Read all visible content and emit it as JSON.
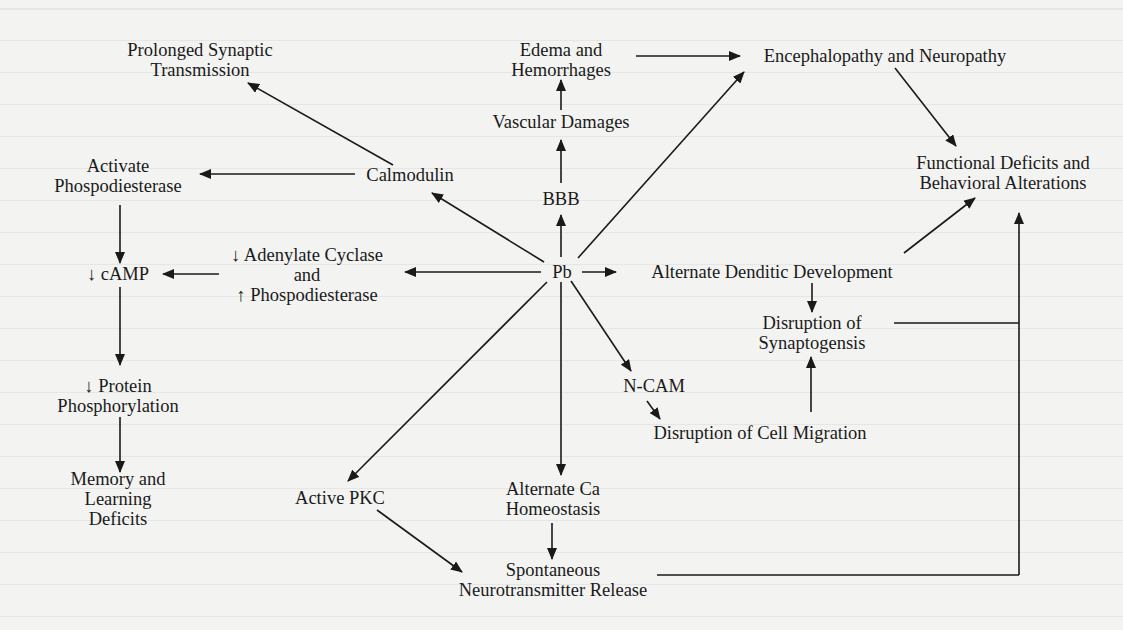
{
  "diagram": {
    "type": "flow",
    "colors": {
      "ink": "#1a1a1a",
      "paper": "#f3f3f2"
    },
    "nodes": {
      "pb": {
        "lines": [
          "Pb"
        ]
      },
      "prolonged": {
        "lines": [
          "Prolonged Synaptic",
          "Transmission"
        ]
      },
      "edema": {
        "lines": [
          "Edema and",
          "Hemorrhages"
        ]
      },
      "enceph": {
        "lines": [
          "Encephalopathy and Neuropathy"
        ]
      },
      "vascular": {
        "lines": [
          "Vascular Damages"
        ]
      },
      "activate_pde": {
        "lines": [
          "Activate",
          "Phospodiesterase"
        ]
      },
      "calmodulin": {
        "lines": [
          "Calmodulin"
        ]
      },
      "bbb": {
        "lines": [
          "BBB"
        ]
      },
      "functional": {
        "lines": [
          "Functional Deficits and",
          "Behavioral Alterations"
        ]
      },
      "adenylate": {
        "lines": [
          "↓ Adenylate Cyclase",
          "and",
          "↑ Phospodiesterase"
        ]
      },
      "camp": {
        "lines": [
          "↓ cAMP"
        ]
      },
      "dendritic": {
        "lines": [
          "Alternate Denditic Development"
        ]
      },
      "synaptogenesis": {
        "lines": [
          "Disruption of",
          "Synaptogensis"
        ]
      },
      "protein": {
        "lines": [
          "↓ Protein",
          "Phosphorylation"
        ]
      },
      "ncam": {
        "lines": [
          "N-CAM"
        ]
      },
      "cell_migration": {
        "lines": [
          "Disruption of Cell Migration"
        ]
      },
      "memory": {
        "lines": [
          "Memory and",
          "Learning",
          "Deficits"
        ]
      },
      "pkc": {
        "lines": [
          "Active PKC"
        ]
      },
      "ca": {
        "lines": [
          "Alternate Ca",
          "Homeostasis"
        ]
      },
      "spontaneous": {
        "lines": [
          "Spontaneous",
          "Neurotransmitter Release"
        ]
      }
    },
    "edges": [
      [
        "Pb",
        "Calmodulin"
      ],
      [
        "Pb",
        "BBB"
      ],
      [
        "Pb",
        "Encephalopathy and Neuropathy"
      ],
      [
        "Pb",
        "Alternate Denditic Development"
      ],
      [
        "Pb",
        "↓ Adenylate Cyclase and ↑ Phospodiesterase"
      ],
      [
        "Pb",
        "N-CAM"
      ],
      [
        "Pb",
        "Alternate Ca Homeostasis"
      ],
      [
        "Pb",
        "Active PKC"
      ],
      [
        "Calmodulin",
        "Prolonged Synaptic Transmission"
      ],
      [
        "Calmodulin",
        "Activate Phospodiesterase"
      ],
      [
        "BBB",
        "Vascular Damages"
      ],
      [
        "Vascular Damages",
        "Edema and Hemorrhages"
      ],
      [
        "Edema and Hemorrhages",
        "Encephalopathy and Neuropathy"
      ],
      [
        "Encephalopathy and Neuropathy",
        "Functional Deficits and Behavioral Alterations"
      ],
      [
        "Activate Phospodiesterase",
        "↓ cAMP"
      ],
      [
        "↓ Adenylate Cyclase and ↑ Phospodiesterase",
        "↓ cAMP"
      ],
      [
        "↓ cAMP",
        "↓ Protein Phosphorylation"
      ],
      [
        "↓ Protein Phosphorylation",
        "Memory and Learning Deficits"
      ],
      [
        "Alternate Denditic Development",
        "Disruption of Synaptogensis"
      ],
      [
        "Alternate Denditic Development",
        "Functional Deficits and Behavioral Alterations"
      ],
      [
        "N-CAM",
        "Disruption of Cell Migration"
      ],
      [
        "Disruption of Cell Migration",
        "Disruption of Synaptogensis"
      ],
      [
        "Disruption of Synaptogensis",
        "Functional Deficits and Behavioral Alterations"
      ],
      [
        "Alternate Ca Homeostasis",
        "Spontaneous Neurotransmitter Release"
      ],
      [
        "Active PKC",
        "Spontaneous Neurotransmitter Release"
      ],
      [
        "Spontaneous Neurotransmitter Release",
        "Functional Deficits and Behavioral Alterations"
      ]
    ]
  }
}
